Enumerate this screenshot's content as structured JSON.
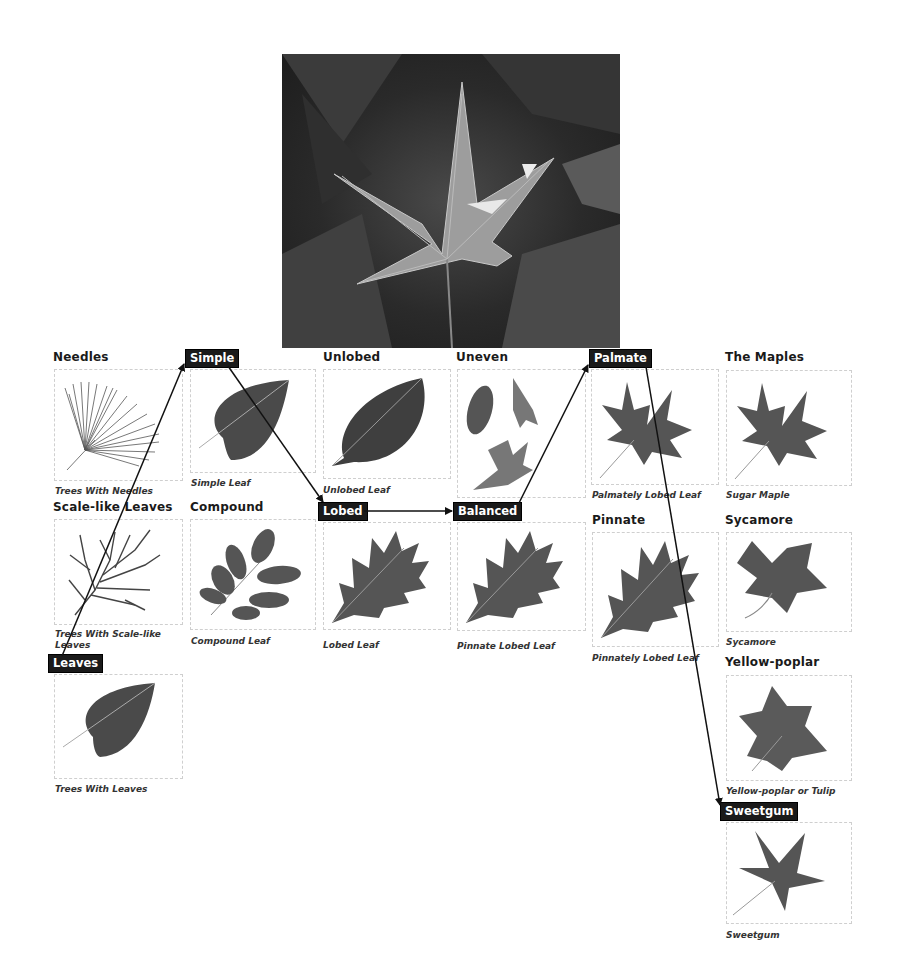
{
  "photo": {
    "subject": "sweetgum-leaf-photo"
  },
  "nodes": {
    "needles": {
      "heading": "Needles",
      "caption": "Trees With Needles"
    },
    "simple": {
      "tag": "Simple",
      "caption": "Simple Leaf"
    },
    "unlobed": {
      "heading": "Unlobed",
      "caption": "Unlobed Leaf"
    },
    "uneven": {
      "heading": "Uneven"
    },
    "palmate": {
      "tag": "Palmate",
      "caption": "Palmately Lobed Leaf"
    },
    "maples": {
      "heading": "The Maples",
      "caption": "Sugar Maple"
    },
    "scale": {
      "heading": "Scale-like Leaves",
      "caption_line1": "Trees With Scale-like",
      "caption_line2": "Leaves"
    },
    "compound": {
      "heading": "Compound",
      "caption": "Compound Leaf"
    },
    "lobed": {
      "tag": "Lobed",
      "caption": "Lobed Leaf"
    },
    "balanced": {
      "tag": "Balanced",
      "caption": "Pinnate Lobed Leaf"
    },
    "pinnate": {
      "heading": "Pinnate",
      "caption": "Pinnately Lobed Leaf"
    },
    "sycamore": {
      "heading": "Sycamore",
      "caption": "Sycamore"
    },
    "leaves": {
      "tag": "Leaves",
      "caption": "Trees With Leaves"
    },
    "yellowpoplar": {
      "heading": "Yellow-poplar",
      "caption": "Yellow-poplar or Tulip"
    },
    "sweetgum": {
      "tag": "Sweetgum",
      "caption": "Sweetgum"
    }
  },
  "path": [
    "Leaves",
    "Simple",
    "Lobed",
    "Balanced",
    "Palmate",
    "Sweetgum"
  ],
  "colors": {
    "tag_bg": "#1a1a1a",
    "tag_text": "#ffffff",
    "arrow": "#111111",
    "box_border": "#cfcfcf"
  }
}
